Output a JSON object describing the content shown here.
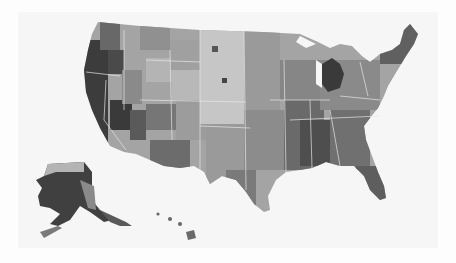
{
  "map": {
    "type": "choropleth",
    "subject": "US counties",
    "palette": [
      "#f2f2f2",
      "#d0d0d0",
      "#a8a8a8",
      "#7e7e7e",
      "#555555",
      "#2e2e2e"
    ],
    "regions_shown": [
      "contiguous-us",
      "alaska",
      "hawaii"
    ],
    "border_color": "#eeeeee",
    "background": "#f6f6f6"
  }
}
